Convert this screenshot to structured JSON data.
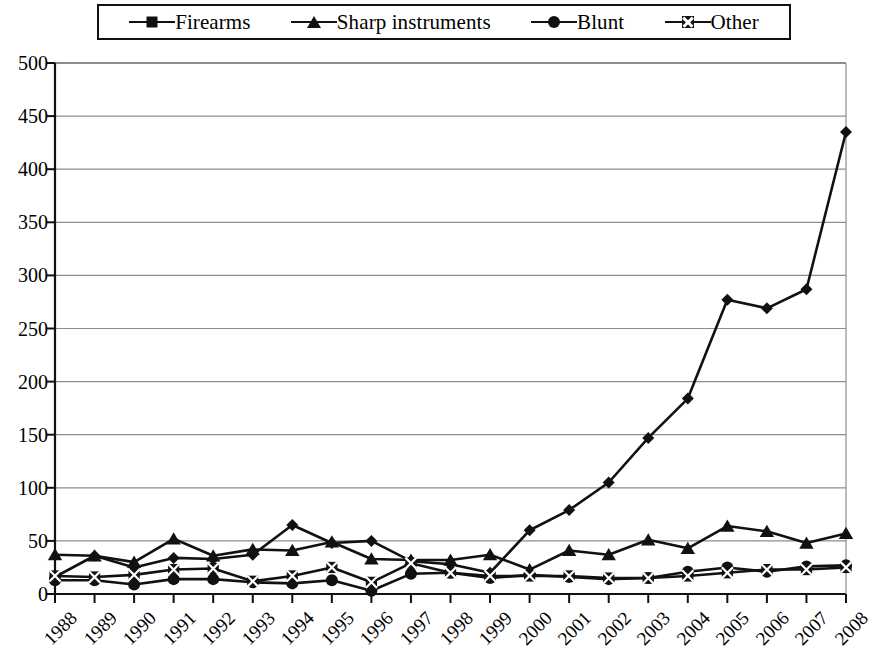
{
  "legend": {
    "position": "top",
    "items": [
      {
        "label": "Firearms",
        "marker": "diamond-marker"
      },
      {
        "label": "Sharp instruments",
        "marker": "triangle-marker"
      },
      {
        "label": "Blunt",
        "marker": "circle-marker"
      },
      {
        "label": "Other",
        "marker": "crossed-square-marker"
      }
    ]
  },
  "chart_data": {
    "type": "line",
    "title": "",
    "subtitle": "",
    "xlabel": "",
    "ylabel": "",
    "grid": true,
    "legend_position": "top",
    "line_color": "#111111",
    "background_color": "#ffffff",
    "xlim": [
      1988,
      2008
    ],
    "ylim": [
      0,
      500
    ],
    "ytick_step": 50,
    "categories": [
      "1988",
      "1989",
      "1990",
      "1991",
      "1992",
      "1993",
      "1994",
      "1995",
      "1996",
      "1997",
      "1998",
      "1999",
      "2000",
      "2001",
      "2002",
      "2003",
      "2004",
      "2005",
      "2006",
      "2007",
      "2008"
    ],
    "yticks": [
      0,
      50,
      100,
      150,
      200,
      250,
      300,
      350,
      400,
      450,
      500
    ],
    "ytick_labels": [
      "0",
      "50",
      "100",
      "150",
      "200",
      "250",
      "300",
      "350",
      "400",
      "450",
      "500"
    ],
    "series": [
      {
        "name": "Firearms",
        "marker": "diamond",
        "values": [
          16,
          36,
          25,
          34,
          33,
          37,
          65,
          48,
          50,
          31,
          28,
          20,
          60,
          79,
          105,
          147,
          184,
          277,
          269,
          287,
          435
        ]
      },
      {
        "name": "Sharp instruments",
        "marker": "triangle",
        "values": [
          37,
          36,
          30,
          52,
          36,
          42,
          41,
          49,
          33,
          32,
          32,
          37,
          23,
          41,
          37,
          51,
          43,
          64,
          59,
          48,
          57
        ]
      },
      {
        "name": "Blunt",
        "marker": "circle",
        "values": [
          13,
          13,
          9,
          14,
          14,
          11,
          10,
          13,
          3,
          19,
          20,
          15,
          18,
          16,
          14,
          15,
          21,
          25,
          21,
          26,
          27
        ]
      },
      {
        "name": "Other",
        "marker": "crossed-square",
        "values": [
          17,
          16,
          18,
          23,
          24,
          12,
          17,
          25,
          11,
          29,
          20,
          17,
          17,
          17,
          15,
          15,
          17,
          20,
          23,
          23,
          25
        ]
      }
    ]
  }
}
